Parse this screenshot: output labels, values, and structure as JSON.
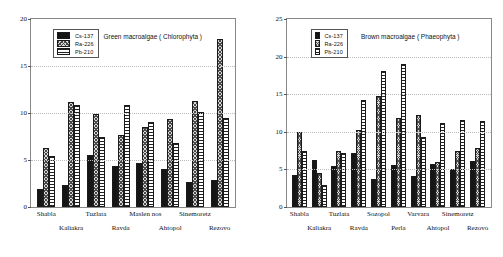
{
  "figure": {
    "panels": [
      "green",
      "brown"
    ]
  },
  "legend": {
    "items": [
      {
        "label": "Cs-137",
        "pattern": "cs137",
        "color": "#151515"
      },
      {
        "label": "Ra-226",
        "pattern": "ra226",
        "color": "#d8d8d8"
      },
      {
        "label": "Pb-210",
        "pattern": "pb210",
        "color": "#ffffff"
      }
    ]
  },
  "chart_data": [
    {
      "type": "bar",
      "title": "Green macroalgae ( Chlorophyta )",
      "xlabel": "",
      "ylabel": "",
      "ylim": [
        0,
        20
      ],
      "yticks": [
        0,
        5,
        10,
        15,
        20
      ],
      "grid": true,
      "legend_position": "upper-left",
      "categories": [
        "Shabla",
        "Kaliakra",
        "Tuzlata",
        "Ravda",
        "Maslen nos",
        "Ahtopol",
        "Sinemoretz",
        "Rezovo"
      ],
      "series": [
        {
          "name": "Cs-137",
          "values": [
            1.9,
            2.3,
            5.5,
            4.4,
            4.7,
            4.0,
            2.7,
            2.9
          ]
        },
        {
          "name": "Ra-226",
          "values": [
            6.3,
            11.2,
            9.9,
            7.7,
            8.5,
            9.4,
            11.3,
            17.9
          ]
        },
        {
          "name": "Pb-210",
          "values": [
            5.4,
            10.9,
            7.5,
            10.9,
            9.0,
            6.8,
            10.1,
            9.5
          ]
        }
      ]
    },
    {
      "type": "bar",
      "title": "Brown macroalgae ( Phaeophyta )",
      "xlabel": "",
      "ylabel": "",
      "ylim": [
        0,
        25
      ],
      "yticks": [
        0,
        5,
        10,
        15,
        20,
        25
      ],
      "grid": true,
      "legend_position": "upper-left",
      "categories": [
        "Shabla",
        "Kaliakra",
        "Tuzlata",
        "Ravda",
        "Sozopol",
        "Perla",
        "Varvara",
        "Ahtopol",
        "Sinemoretz",
        "Rezovo"
      ],
      "series": [
        {
          "name": "Cs-137",
          "values": [
            4.3,
            6.2,
            5.4,
            7.2,
            3.7,
            5.6,
            4.1,
            5.7,
            5.0,
            6.1
          ]
        },
        {
          "name": "Ra-226",
          "values": [
            10.0,
            4.5,
            7.5,
            10.3,
            14.8,
            11.8,
            12.2,
            6.0,
            7.4,
            7.9
          ]
        },
        {
          "name": "Pb-210",
          "values": [
            7.5,
            2.9,
            7.2,
            14.2,
            18.1,
            19.0,
            9.3,
            11.2,
            11.6,
            11.5
          ]
        }
      ]
    }
  ]
}
